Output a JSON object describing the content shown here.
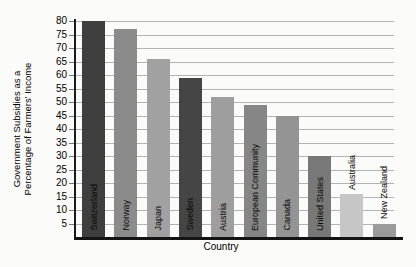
{
  "chart_data": {
    "type": "bar",
    "title": "",
    "xlabel": "Country",
    "ylabel_line1": "Government Subsidies as a",
    "ylabel_line2": "Percentage of Farmers' Income",
    "categories": [
      "Switzerland",
      "Norway",
      "Japan",
      "Sweden",
      "Austria",
      "European Community",
      "Canada",
      "United States",
      "Australia",
      "New Zealand"
    ],
    "values": [
      80,
      77,
      66,
      59,
      52,
      49,
      45,
      30,
      16,
      5
    ],
    "bar_colors": [
      "#3f3f3f",
      "#8b8b8b",
      "#a1a1a1",
      "#454545",
      "#9e9e9e",
      "#868686",
      "#949494",
      "#787878",
      "#c6c6c6",
      "#9b9b9b"
    ],
    "label_placement": [
      "inside",
      "inside",
      "inside",
      "inside",
      "inside",
      "inside",
      "inside",
      "inside",
      "above",
      "above"
    ],
    "y_ticks": [
      5,
      10,
      15,
      20,
      25,
      30,
      35,
      40,
      45,
      50,
      55,
      60,
      65,
      70,
      75,
      80
    ],
    "ylim": [
      0,
      80
    ],
    "grid": true,
    "legend": false,
    "gridline_color": "#b3b3b3",
    "axis_color": "#1a1a1a",
    "text_color": "#000000"
  }
}
